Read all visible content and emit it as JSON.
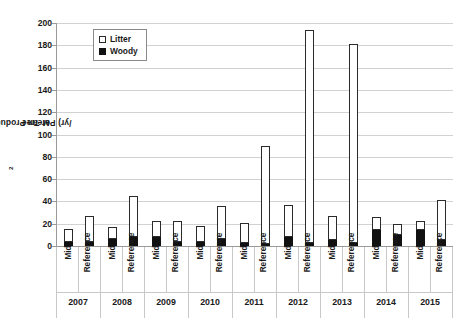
{
  "chart_data": {
    "type": "bar",
    "title": "",
    "subtitle": "",
    "xlabel": "",
    "ylabel": "Mean Productivity (g/m2/yr) Per Tree",
    "ylabel_parts": {
      "before": "Mean Productivity (g/m",
      "sup": "2",
      "after": "/yr) Per Tree"
    },
    "ylim": [
      0,
      200
    ],
    "yticks": [
      0,
      20,
      40,
      60,
      80,
      100,
      120,
      140,
      160,
      180,
      200
    ],
    "ytick_labels": [
      "0",
      "20",
      "40",
      "60",
      "80",
      "100",
      "120",
      "140",
      "160",
      "180",
      "200"
    ],
    "grid": true,
    "grid_axis": "y",
    "stacked": true,
    "legend": {
      "position": "upper-left-inside",
      "entries": [
        {
          "label": "Litter",
          "swatch": "open-square",
          "color": "#ffffff",
          "edge": "#2b2b2b"
        },
        {
          "label": "Woody",
          "swatch": "filled-square",
          "color": "#111111",
          "edge": "#111111"
        }
      ]
    },
    "groups": [
      "2007",
      "2008",
      "2009",
      "2010",
      "2011",
      "2012",
      "2013",
      "2014",
      "2015"
    ],
    "subcategories": [
      "Mid",
      "Reference"
    ],
    "series": [
      {
        "name": "Woody",
        "color": "#111111",
        "values": [
          4,
          4,
          6,
          8,
          8,
          4,
          4,
          6,
          3,
          2,
          8,
          3,
          5,
          3,
          14,
          10,
          14,
          5
        ]
      },
      {
        "name": "Litter",
        "color": "#ffffff",
        "values": [
          11,
          23,
          11,
          37,
          14,
          18,
          14,
          30,
          18,
          88,
          29,
          191,
          22,
          178,
          12,
          10,
          8,
          36
        ]
      }
    ],
    "bars": [
      {
        "group": "2007",
        "sub": "Mid",
        "woody": 4,
        "litter": 11,
        "total": 15
      },
      {
        "group": "2007",
        "sub": "Reference",
        "woody": 4,
        "litter": 23,
        "total": 27
      },
      {
        "group": "2008",
        "sub": "Mid",
        "woody": 6,
        "litter": 11,
        "total": 17
      },
      {
        "group": "2008",
        "sub": "Reference",
        "woody": 8,
        "litter": 37,
        "total": 45
      },
      {
        "group": "2009",
        "sub": "Mid",
        "woody": 8,
        "litter": 14,
        "total": 22
      },
      {
        "group": "2009",
        "sub": "Reference",
        "woody": 4,
        "litter": 18,
        "total": 22
      },
      {
        "group": "2010",
        "sub": "Mid",
        "woody": 4,
        "litter": 14,
        "total": 18
      },
      {
        "group": "2010",
        "sub": "Reference",
        "woody": 6,
        "litter": 30,
        "total": 36
      },
      {
        "group": "2011",
        "sub": "Mid",
        "woody": 3,
        "litter": 18,
        "total": 21
      },
      {
        "group": "2011",
        "sub": "Reference",
        "woody": 2,
        "litter": 88,
        "total": 90
      },
      {
        "group": "2012",
        "sub": "Mid",
        "woody": 8,
        "litter": 29,
        "total": 37
      },
      {
        "group": "2012",
        "sub": "Reference",
        "woody": 3,
        "litter": 191,
        "total": 194
      },
      {
        "group": "2013",
        "sub": "Mid",
        "woody": 5,
        "litter": 22,
        "total": 27
      },
      {
        "group": "2013",
        "sub": "Reference",
        "woody": 3,
        "litter": 178,
        "total": 181
      },
      {
        "group": "2014",
        "sub": "Mid",
        "woody": 14,
        "litter": 12,
        "total": 26
      },
      {
        "group": "2014",
        "sub": "Reference",
        "woody": 10,
        "litter": 10,
        "total": 20
      },
      {
        "group": "2015",
        "sub": "Mid",
        "woody": 14,
        "litter": 8,
        "total": 22
      },
      {
        "group": "2015",
        "sub": "Reference",
        "woody": 5,
        "litter": 36,
        "total": 41
      }
    ]
  }
}
